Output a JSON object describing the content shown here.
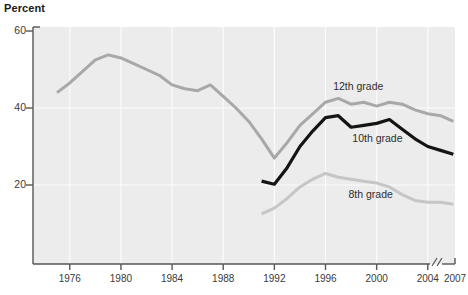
{
  "chart_data": {
    "type": "line",
    "title": "",
    "ylabel": "Percent",
    "xlabel": "",
    "ylim": [
      0,
      60
    ],
    "xlim": [
      1975,
      2007
    ],
    "grid": true,
    "legend_position": "inline-annotations",
    "axis_break": {
      "symbol": "//",
      "between": [
        "2004",
        "2007"
      ]
    },
    "ytick_labels": [
      "60",
      "40",
      "20"
    ],
    "ytick_values": [
      60,
      40,
      20
    ],
    "xtick_labels": [
      "1976",
      "1980",
      "1984",
      "1988",
      "1992",
      "1996",
      "2000",
      "2004",
      "2007"
    ],
    "xtick_values": [
      1976,
      1980,
      1984,
      1988,
      1992,
      1996,
      2000,
      2004,
      2007
    ],
    "series": [
      {
        "name": "12th grade",
        "color": "#a8a8a8",
        "label_x": 1996.6,
        "label_y": 45.5,
        "x": [
          1975,
          1976,
          1977,
          1978,
          1979,
          1980,
          1981,
          1982,
          1983,
          1984,
          1985,
          1986,
          1987,
          1988,
          1989,
          1990,
          1991,
          1992,
          1993,
          1994,
          1995,
          1996,
          1997,
          1998,
          1999,
          2000,
          2001,
          2002,
          2003,
          2004,
          2005,
          2006
        ],
        "values": [
          44.0,
          46.5,
          49.5,
          52.5,
          53.8,
          53.0,
          51.5,
          50.0,
          48.5,
          46.0,
          45.0,
          44.5,
          46.0,
          43.0,
          40.0,
          36.5,
          32.0,
          27.0,
          31.0,
          35.5,
          38.5,
          41.5,
          42.5,
          41.0,
          41.5,
          40.5,
          41.5,
          41.0,
          39.5,
          38.5,
          38.0,
          36.5
        ]
      },
      {
        "name": "10th grade",
        "color": "#141414",
        "label_x": 1998.1,
        "label_y": 32.0,
        "x": [
          1991,
          1992,
          1993,
          1994,
          1995,
          1996,
          1997,
          1998,
          1999,
          2000,
          2001,
          2002,
          2003,
          2004,
          2005,
          2006
        ],
        "values": [
          21.0,
          20.2,
          24.5,
          30.0,
          34.0,
          37.5,
          38.0,
          35.0,
          35.5,
          36.0,
          37.0,
          34.5,
          32.0,
          30.0,
          29.0,
          28.0
        ]
      },
      {
        "name": "8th grade",
        "color": "#c6c6c6",
        "label_x": 1997.8,
        "label_y": 17.3,
        "x": [
          1991,
          1992,
          1993,
          1994,
          1995,
          1996,
          1997,
          1998,
          1999,
          2000,
          2001,
          2002,
          2003,
          2004,
          2005,
          2006
        ],
        "values": [
          12.5,
          14.0,
          16.5,
          19.5,
          21.5,
          23.0,
          22.0,
          21.5,
          21.0,
          20.5,
          19.5,
          17.5,
          16.0,
          15.5,
          15.5,
          15.0
        ]
      }
    ]
  }
}
